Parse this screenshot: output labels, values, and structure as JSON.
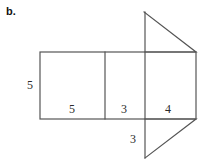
{
  "figure": {
    "part_letter": "b.",
    "kind": "net-of-triangular-prism",
    "background_color": "#ffffff",
    "stroke_color": "#555555",
    "text_color": "#2b2b2b",
    "stroke_width": 1.2,
    "canvas": {
      "width": 211,
      "height": 161
    }
  },
  "labels": {
    "height_left": "5",
    "base_first": "5",
    "base_second": "3",
    "base_third": "4",
    "fold_bottom": "3"
  },
  "geometry": {
    "rectangle": {
      "left": 40,
      "right": 196,
      "top": 52,
      "bottom": 119,
      "height_value": "5"
    },
    "dividers": [
      {
        "name": "divider-1",
        "x": 105
      },
      {
        "name": "divider-2",
        "x": 145
      }
    ],
    "panels": [
      {
        "name": "panel-5",
        "x1": 40,
        "x2": 105,
        "value": "5"
      },
      {
        "name": "panel-3",
        "x1": 105,
        "x2": 145,
        "value": "3"
      },
      {
        "name": "panel-4",
        "x1": 145,
        "x2": 196,
        "value": "4"
      }
    ],
    "top_triangle": {
      "apex": {
        "x": 144,
        "y": 12
      },
      "base_right": {
        "x": 196,
        "y": 52
      },
      "base_left": {
        "x": 145,
        "y": 52
      }
    },
    "bottom_triangle": {
      "apex": {
        "x": 145,
        "y": 158
      },
      "base_right": {
        "x": 196,
        "y": 119
      },
      "base_left": {
        "x": 145,
        "y": 119
      }
    },
    "fold_line": {
      "x": 145,
      "y_top": 12,
      "y_bottom": 158
    }
  }
}
